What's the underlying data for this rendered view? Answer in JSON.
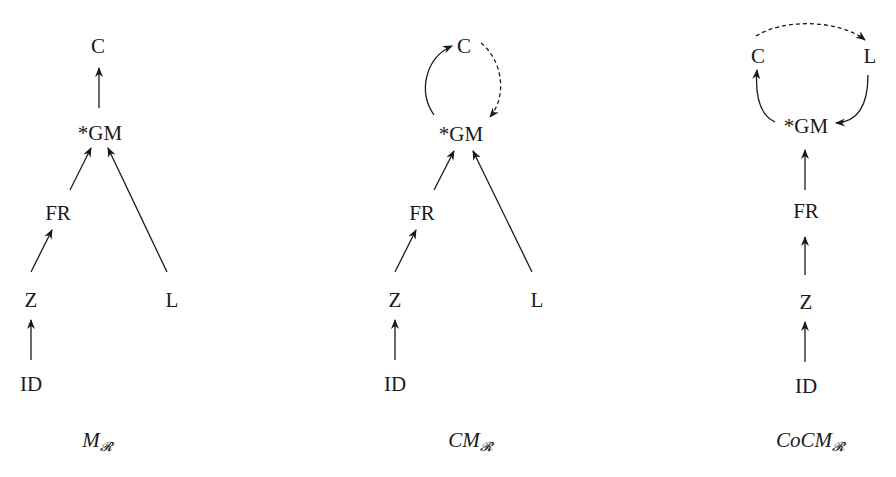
{
  "diagrams": [
    {
      "id": "m_r",
      "caption": {
        "main": "M",
        "subscript": "𝓡"
      },
      "nodes": {
        "C": "C",
        "GM": "*GM",
        "FR": "FR",
        "Z": "Z",
        "L": "L",
        "ID": "ID"
      },
      "edges": [
        {
          "from": "*GM",
          "to": "C",
          "style": "solid"
        },
        {
          "from": "FR",
          "to": "*GM",
          "style": "solid"
        },
        {
          "from": "L",
          "to": "*GM",
          "style": "solid"
        },
        {
          "from": "Z",
          "to": "FR",
          "style": "solid"
        },
        {
          "from": "ID",
          "to": "Z",
          "style": "solid"
        }
      ]
    },
    {
      "id": "cm_r",
      "caption": {
        "main": "CM",
        "subscript": "𝓡"
      },
      "nodes": {
        "C": "C",
        "GM": "*GM",
        "FR": "FR",
        "Z": "Z",
        "L": "L",
        "ID": "ID"
      },
      "edges": [
        {
          "from": "*GM",
          "to": "C",
          "style": "solid-curved"
        },
        {
          "from": "C",
          "to": "*GM",
          "style": "dashed-curved"
        },
        {
          "from": "FR",
          "to": "*GM",
          "style": "solid"
        },
        {
          "from": "L",
          "to": "*GM",
          "style": "solid"
        },
        {
          "from": "Z",
          "to": "FR",
          "style": "solid"
        },
        {
          "from": "ID",
          "to": "Z",
          "style": "solid"
        }
      ]
    },
    {
      "id": "cocm_r",
      "caption": {
        "main": "CoCM",
        "subscript": "𝓡"
      },
      "nodes": {
        "C": "C",
        "L": "L",
        "GM": "*GM",
        "FR": "FR",
        "Z": "Z",
        "ID": "ID"
      },
      "edges": [
        {
          "from": "C",
          "to": "L",
          "style": "dashed-curved"
        },
        {
          "from": "*GM",
          "to": "C",
          "style": "solid-curved"
        },
        {
          "from": "L",
          "to": "*GM",
          "style": "solid-curved"
        },
        {
          "from": "FR",
          "to": "*GM",
          "style": "solid"
        },
        {
          "from": "Z",
          "to": "FR",
          "style": "solid"
        },
        {
          "from": "ID",
          "to": "Z",
          "style": "solid"
        }
      ]
    }
  ]
}
